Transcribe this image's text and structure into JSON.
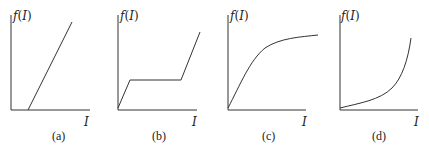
{
  "panels": [
    {
      "id": "a",
      "caption": "(a)",
      "y_label": "f(I)",
      "x_label": "I",
      "description": "Linear increase starting from positive I threshold"
    },
    {
      "id": "b",
      "caption": "(b)",
      "y_label": "f(I)",
      "x_label": "I",
      "description": "Rise, plateau, then rise again"
    },
    {
      "id": "c",
      "caption": "(c)",
      "y_label": "f(I)",
      "x_label": "I",
      "description": "Saturating (concave) curve"
    },
    {
      "id": "d",
      "caption": "(d)",
      "y_label": "f(I)",
      "x_label": "I",
      "description": "Convex, exponential-like growth"
    }
  ]
}
